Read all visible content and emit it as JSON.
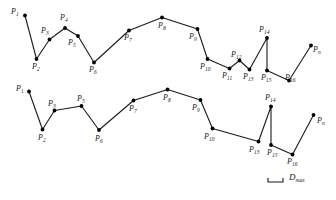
{
  "figure": {
    "caption": "",
    "stroke_color": "#1a1a1a",
    "vertex_color": "#000000",
    "background_color": "#ffffff",
    "line_width": 1.1,
    "vertex_radius": 1.9
  },
  "chart_data": {
    "type": "line",
    "title": "",
    "subtitle": "",
    "xlabel": "",
    "ylabel": "",
    "grid": false,
    "legend": "none",
    "xlim": [
      0,
      336
    ],
    "ylim": [
      200,
      0
    ],
    "annotations": [
      {
        "name": "tolerance-bar",
        "label": "D",
        "sublabel": "max",
        "x1": 268,
        "x2": 283,
        "y": 182
      }
    ],
    "series": [
      {
        "name": "original-polyline",
        "description": "Original polyline with all vertices P1..P16, Pn",
        "points": [
          {
            "label": "P",
            "sub": "1",
            "x": 25.0,
            "y": 15.5
          },
          {
            "label": "P",
            "sub": "2",
            "x": 36.5,
            "y": 59.0
          },
          {
            "label": "P",
            "sub": "3",
            "x": 49.5,
            "y": 39.5
          },
          {
            "label": "P",
            "sub": "4",
            "x": 65.0,
            "y": 28.0
          },
          {
            "label": "P",
            "sub": "5",
            "x": 78.0,
            "y": 36.0
          },
          {
            "label": "P",
            "sub": "6",
            "x": 94.0,
            "y": 62.5
          },
          {
            "label": "P",
            "sub": "7",
            "x": 129.0,
            "y": 30.5
          },
          {
            "label": "P",
            "sub": "8",
            "x": 162.0,
            "y": 17.5
          },
          {
            "label": "P",
            "sub": "9",
            "x": 197.5,
            "y": 29.0
          },
          {
            "label": "P",
            "sub": "10",
            "x": 207.5,
            "y": 59.0
          },
          {
            "label": "P",
            "sub": "11",
            "x": 229.5,
            "y": 68.5
          },
          {
            "label": "P",
            "sub": "12",
            "x": 239.5,
            "y": 60.5
          },
          {
            "label": "P",
            "sub": "13",
            "x": 249.5,
            "y": 69.5
          },
          {
            "label": "P",
            "sub": "14",
            "x": 267.0,
            "y": 38.0
          },
          {
            "label": "P",
            "sub": "15",
            "x": 267.0,
            "y": 70.5
          },
          {
            "label": "P",
            "sub": "16",
            "x": 289.0,
            "y": 80.5
          },
          {
            "label": "P",
            "sub": "n",
            "x": 311.0,
            "y": 45.5
          }
        ]
      },
      {
        "name": "simplified-polyline",
        "description": "Simplified polyline after removing P4, P11, P12",
        "points": [
          {
            "label": "P",
            "sub": "1",
            "x": 29.0,
            "y": 91.5
          },
          {
            "label": "P",
            "sub": "2",
            "x": 42.5,
            "y": 129.5
          },
          {
            "label": "P",
            "sub": "3",
            "x": 54.5,
            "y": 110.5
          },
          {
            "label": "P",
            "sub": "5",
            "x": 81.5,
            "y": 106.0
          },
          {
            "label": "P",
            "sub": "6",
            "x": 99.0,
            "y": 130.0
          },
          {
            "label": "P",
            "sub": "7",
            "x": 133.5,
            "y": 100.5
          },
          {
            "label": "P",
            "sub": "8",
            "x": 167.5,
            "y": 89.5
          },
          {
            "label": "P",
            "sub": "9",
            "x": 200.5,
            "y": 100.0
          },
          {
            "label": "P",
            "sub": "10",
            "x": 212.5,
            "y": 128.5
          },
          {
            "label": "P",
            "sub": "13",
            "x": 258.5,
            "y": 141.5
          },
          {
            "label": "P",
            "sub": "14",
            "x": 271.0,
            "y": 106.5
          },
          {
            "label": "P",
            "sub": "15",
            "x": 271.0,
            "y": 145.0
          },
          {
            "label": "P",
            "sub": "16",
            "x": 292.5,
            "y": 154.5
          },
          {
            "label": "P",
            "sub": "n",
            "x": 313.5,
            "y": 115.0
          }
        ]
      }
    ],
    "labels": {
      "top": [
        {
          "text": "P",
          "sub": "1",
          "x": 11,
          "y": 8
        },
        {
          "text": "P",
          "sub": "2",
          "x": 32,
          "y": 63
        },
        {
          "text": "P",
          "sub": "3",
          "x": 41,
          "y": 27
        },
        {
          "text": "P",
          "sub": "4",
          "x": 60,
          "y": 14
        },
        {
          "text": "P",
          "sub": "5",
          "x": 68,
          "y": 39
        },
        {
          "text": "P",
          "sub": "6",
          "x": 89,
          "y": 66
        },
        {
          "text": "P",
          "sub": "7",
          "x": 124,
          "y": 34
        },
        {
          "text": "P",
          "sub": "8",
          "x": 158,
          "y": 22
        },
        {
          "text": "P",
          "sub": "9",
          "x": 189,
          "y": 33
        },
        {
          "text": "P",
          "sub": "10",
          "x": 200,
          "y": 63
        },
        {
          "text": "P",
          "sub": "11",
          "x": 222,
          "y": 72
        },
        {
          "text": "P",
          "sub": "12",
          "x": 231,
          "y": 51
        },
        {
          "text": "P",
          "sub": "13",
          "x": 243,
          "y": 73
        },
        {
          "text": "P",
          "sub": "14",
          "x": 259,
          "y": 26
        },
        {
          "text": "P",
          "sub": "15",
          "x": 261,
          "y": 74
        },
        {
          "text": "P",
          "sub": "16",
          "x": 285,
          "y": 74
        },
        {
          "text": "P",
          "sub": "n",
          "x": 313,
          "y": 46
        }
      ],
      "bottom": [
        {
          "text": "P",
          "sub": "1",
          "x": 16,
          "y": 85
        },
        {
          "text": "P",
          "sub": "2",
          "x": 38,
          "y": 134
        },
        {
          "text": "P",
          "sub": "3",
          "x": 48,
          "y": 100
        },
        {
          "text": "P",
          "sub": "5",
          "x": 77,
          "y": 95
        },
        {
          "text": "P",
          "sub": "6",
          "x": 95,
          "y": 135
        },
        {
          "text": "P",
          "sub": "7",
          "x": 129,
          "y": 105
        },
        {
          "text": "P",
          "sub": "8",
          "x": 163,
          "y": 94
        },
        {
          "text": "P",
          "sub": "9",
          "x": 192,
          "y": 104
        },
        {
          "text": "P",
          "sub": "10",
          "x": 204,
          "y": 133
        },
        {
          "text": "P",
          "sub": "13",
          "x": 249,
          "y": 146
        },
        {
          "text": "P",
          "sub": "14",
          "x": 265,
          "y": 94
        },
        {
          "text": "P",
          "sub": "15",
          "x": 267,
          "y": 149
        },
        {
          "text": "P",
          "sub": "16",
          "x": 287,
          "y": 158
        },
        {
          "text": "P",
          "sub": "n",
          "x": 317,
          "y": 117
        }
      ]
    }
  }
}
